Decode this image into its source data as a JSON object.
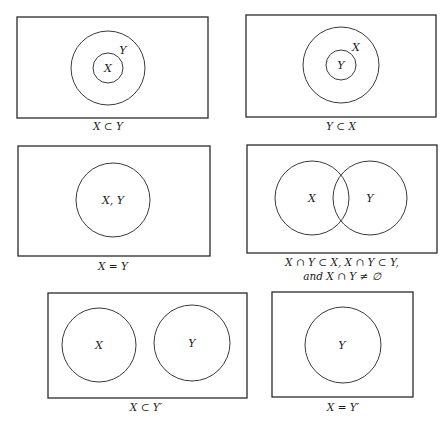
{
  "figure": {
    "panels": [
      {
        "id": "subset-x-in-y",
        "sets": [
          {
            "name": "X",
            "role": "inner"
          },
          {
            "name": "Y",
            "role": "outer"
          }
        ],
        "labels": {
          "inner": "X",
          "outer": "Y"
        },
        "caption": "X ⊂ Y"
      },
      {
        "id": "subset-y-in-x",
        "sets": [
          {
            "name": "Y",
            "role": "inner"
          },
          {
            "name": "X",
            "role": "outer"
          }
        ],
        "labels": {
          "inner": "Y",
          "outer": "X"
        },
        "caption": "Y ⊂ X"
      },
      {
        "id": "equal-sets",
        "labels": {
          "circle": "X, Y"
        },
        "caption": "X = Y"
      },
      {
        "id": "overlapping-sets",
        "labels": {
          "left": "X",
          "right": "Y"
        },
        "caption_line1": "X ∩ Y ⊂ X, X ∩ Y ⊂ Y,",
        "caption_line2": "and X ∩ Y ≠ ∅"
      },
      {
        "id": "disjoint-sets",
        "labels": {
          "left": "X",
          "right": "Y"
        },
        "caption": "X ⊂ Y′"
      },
      {
        "id": "complement-sets",
        "labels": {
          "circle": "Y"
        },
        "caption": "X = Y′"
      }
    ],
    "colors": {
      "background": "#ffffff",
      "stroke": "#2a2a2a",
      "text": "#1a1a1a"
    }
  }
}
